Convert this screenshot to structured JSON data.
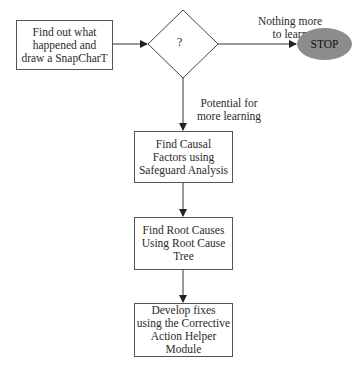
{
  "diagram": {
    "type": "flowchart",
    "nodes": {
      "start_box": {
        "lines": [
          "Find out what",
          "happened and",
          "draw a SnapCharT"
        ]
      },
      "decision": {
        "label": "?"
      },
      "stop": {
        "label": "STOP"
      },
      "causal_box": {
        "lines": [
          "Find Causal",
          "Factors using",
          "Safeguard Analysis"
        ]
      },
      "root_box": {
        "lines": [
          "Find Root Causes",
          "Using Root Cause",
          "Tree"
        ]
      },
      "fix_box": {
        "lines": [
          "Develop fixes",
          "using the Corrective",
          "Action Helper",
          "Module"
        ]
      }
    },
    "edges": {
      "no_more": {
        "lines": [
          "Nothing more",
          "to learn"
        ]
      },
      "potential": {
        "lines": [
          "Potential for",
          "more learning"
        ]
      }
    },
    "colors": {
      "line": "#333333",
      "stop_fill": "#8c8c8c",
      "box_border": "#555555"
    }
  }
}
